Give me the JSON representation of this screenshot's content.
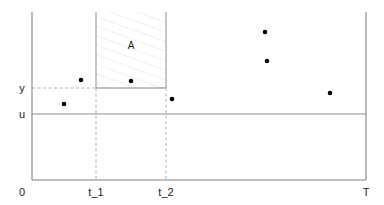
{
  "figure": {
    "title": "",
    "region_label": "A",
    "axis_labels": {
      "x_origin": "0",
      "x_t1": "t_1",
      "x_t2": "t_2",
      "x_end": "T",
      "y_threshold": "y",
      "y_baseline": "u"
    },
    "colors": {
      "axis": "#808080",
      "guide": "#b0b0b0",
      "hatch": "#c8c8c8",
      "point": "#000000",
      "text": "#1a1a1a",
      "background": "#ffffff"
    }
  },
  "chart_data": {
    "type": "scatter",
    "title": "",
    "xlabel": "",
    "ylabel": "",
    "xlim": [
      0,
      384
    ],
    "ylim": [
      0,
      205
    ],
    "grid": false,
    "legend": null,
    "categories": [],
    "x_ticks": [
      {
        "label": "0",
        "px": 32
      },
      {
        "label": "t_1",
        "px": 96
      },
      {
        "label": "t_2",
        "px": 166
      },
      {
        "label": "T",
        "px": 366
      }
    ],
    "y_ticks": [
      {
        "label": "y",
        "px": 88
      },
      {
        "label": "u",
        "px": 114
      }
    ],
    "series": [
      {
        "name": "observations",
        "points": [
          {
            "x": 64,
            "y": 104
          },
          {
            "x": 81,
            "y": 80
          },
          {
            "x": 131,
            "y": 81
          },
          {
            "x": 172,
            "y": 99
          },
          {
            "x": 265,
            "y": 32
          },
          {
            "x": 267,
            "y": 61
          },
          {
            "x": 330,
            "y": 93
          }
        ]
      }
    ],
    "annotations": [
      {
        "label": "A",
        "type": "hatched-rectangle",
        "x0": 96,
        "x1": 166,
        "y0": 12,
        "y1": 88,
        "label_x": 131,
        "label_y": 48
      }
    ],
    "reference_lines": [
      {
        "name": "y-threshold",
        "orientation": "horizontal",
        "px": 88,
        "style": "dashed",
        "from": 32,
        "to": 166
      },
      {
        "name": "u-baseline",
        "orientation": "horizontal",
        "px": 114,
        "style": "solid",
        "from": 32,
        "to": 366
      },
      {
        "name": "t1-marker",
        "orientation": "vertical",
        "px": 96,
        "style": "dashed",
        "from": 12,
        "to": 180
      },
      {
        "name": "t2-marker",
        "orientation": "vertical",
        "px": 166,
        "style": "dashed",
        "from": 12,
        "to": 180
      }
    ]
  }
}
